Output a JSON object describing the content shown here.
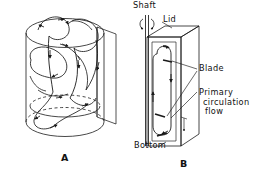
{
  "figure": {
    "background_color": "#ffffff",
    "line_color": "#1a1a1a",
    "panels": [
      {
        "id": "A",
        "caption": "A",
        "shape": "cylinder",
        "description": "Cylindrical vessel with swirling three-dimensional circulation streamlines and directional arrowheads",
        "hidden_edge_style": "dashed"
      },
      {
        "id": "B",
        "caption": "B",
        "shape": "rectangular-box",
        "description": "Rectangular vessel cross-section with vertical shaft and a single closed primary circulation loop",
        "labels": [
          {
            "name": "shaft",
            "text": "Shaft"
          },
          {
            "name": "lid",
            "text": "Lid"
          },
          {
            "name": "blade",
            "text": "Blade"
          },
          {
            "name": "primary-circulation-flow",
            "text_lines": [
              "Primary",
              "circulation",
              "flow"
            ]
          },
          {
            "name": "bottom",
            "text": "Bottom"
          }
        ]
      }
    ]
  },
  "labels": {
    "shaft": "Shaft",
    "lid": "Lid",
    "blade": "Blade",
    "primary": "Primary",
    "circulation": "circulation",
    "flow": "flow",
    "bottom": "Bottom"
  },
  "captions": {
    "panel_a": "A",
    "panel_b": "B"
  }
}
